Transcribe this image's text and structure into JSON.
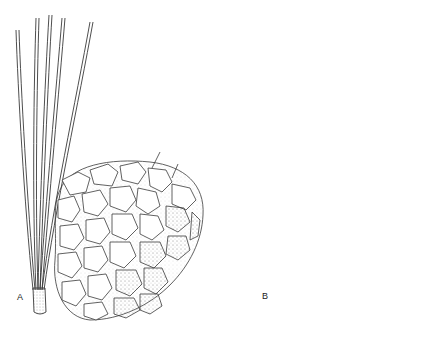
{
  "figure": {
    "type": "botanical illustration",
    "panels": [
      {
        "label": "A",
        "contents": [
          "needle fascicle of five needles with basal sheath",
          "open seed cone with rhomboid scales, stippled shading"
        ]
      },
      {
        "label": "B",
        "contents": [
          "ovoid closed seed cone with imbricate scales",
          "needle fascicle of two needles with basal sheath"
        ]
      }
    ],
    "colors": {
      "ink": "#3a3a3a",
      "background": "#ffffff"
    }
  }
}
